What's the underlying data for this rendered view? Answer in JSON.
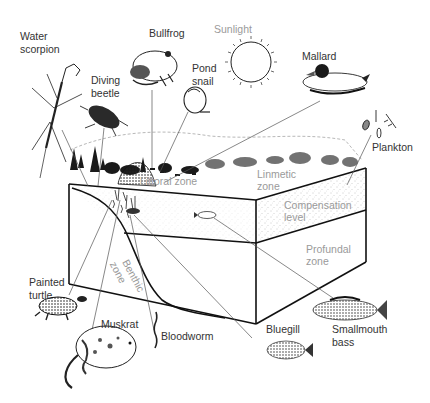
{
  "diagram": {
    "organism_labels": {
      "water_scorpion": [
        "Water",
        "scorpion"
      ],
      "bullfrog": [
        "Bullfrog"
      ],
      "diving_beetle": [
        "Diving",
        "beetle"
      ],
      "pond_snail": [
        "Pond",
        "snail"
      ],
      "sunlight": [
        "Sunlight"
      ],
      "mallard": [
        "Mallard"
      ],
      "plankton": [
        "Plankton"
      ],
      "painted_turtle": [
        "Painted",
        "turtle"
      ],
      "muskrat": [
        "Muskrat"
      ],
      "bloodworm": [
        "Bloodworm"
      ],
      "bluegill": [
        "Bluegill"
      ],
      "smallmouth_bass": [
        "Smallmouth",
        "bass"
      ]
    },
    "zone_labels": {
      "littoral": [
        "Littoral zone"
      ],
      "limnetic": [
        "Linmetic",
        "zone"
      ],
      "compensation": [
        "Compensation",
        "level"
      ],
      "profundal": [
        "Profundal",
        "zone"
      ],
      "benthic": [
        "Benthic",
        "zone"
      ]
    },
    "colors": {
      "ink": "#111111",
      "label_text": "#333333",
      "zone_text": "#9a9a9a",
      "background": "#ffffff"
    }
  }
}
